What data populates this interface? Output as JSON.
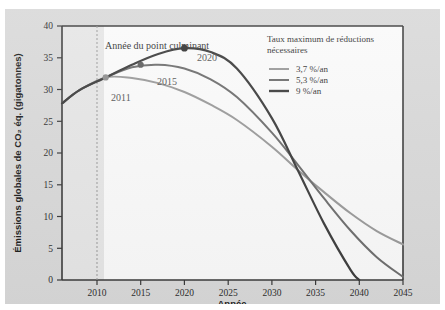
{
  "figure": {
    "background_color": "#d9d9d9",
    "plot_background_color": "#fafafa",
    "annotation": "Année du point culminant"
  },
  "legend": {
    "title_line1": "Taux maximum de réductions",
    "title_line2": "nécessaires",
    "entries": [
      {
        "label": "3,7 %/an",
        "color": "#9a9a9a"
      },
      {
        "label": "5,3 %/an",
        "color": "#6e6e6e"
      },
      {
        "label": "9 %/an",
        "color": "#3d3d3d"
      }
    ]
  },
  "peak_labels": [
    {
      "text": "2011",
      "x": 2011,
      "y": 31.9
    },
    {
      "text": "2015",
      "x": 2015,
      "y": 33.9
    },
    {
      "text": "2020",
      "x": 2020,
      "y": 36.5
    }
  ],
  "chart_data": {
    "type": "line",
    "title": "",
    "xlabel": "Année",
    "ylabel": "Émissions globales de CO₂ éq. (gigatonnes)",
    "xlim": [
      2006,
      2045
    ],
    "ylim": [
      0,
      40
    ],
    "xticks": [
      2010,
      2015,
      2020,
      2025,
      2030,
      2035,
      2040,
      2045
    ],
    "yticks": [
      0,
      5,
      10,
      15,
      20,
      25,
      30,
      35,
      40
    ],
    "grid": false,
    "legend_position": "upper right",
    "peak_year_line": 2010,
    "series": [
      {
        "name": "3,7 %/an",
        "color": "#9a9a9a",
        "peak_year": 2011,
        "peak_value": 31.9,
        "x": [
          2006,
          2008,
          2011,
          2014,
          2017,
          2020,
          2023,
          2026,
          2030,
          2033,
          2036,
          2039,
          2042,
          2045
        ],
        "values": [
          27.8,
          29.9,
          31.9,
          31.8,
          31.0,
          29.6,
          27.6,
          25.2,
          21.0,
          17.3,
          13.8,
          10.5,
          7.7,
          5.6
        ]
      },
      {
        "name": "5,3 %/an",
        "color": "#6e6e6e",
        "peak_year": 2015,
        "peak_value": 33.9,
        "x": [
          2006,
          2008,
          2011,
          2014,
          2017,
          2020,
          2023,
          2026,
          2030,
          2033,
          2036,
          2039,
          2042,
          2045
        ],
        "values": [
          27.8,
          29.9,
          31.9,
          33.5,
          33.9,
          33.3,
          31.6,
          28.8,
          23.2,
          18.1,
          12.8,
          7.8,
          3.6,
          0.5
        ]
      },
      {
        "name": "9 %/an",
        "color": "#3d3d3d",
        "peak_year": 2020,
        "peak_value": 36.5,
        "x": [
          2006,
          2008,
          2011,
          2014,
          2017,
          2020,
          2023,
          2026,
          2030,
          2033,
          2036,
          2039,
          2040
        ],
        "values": [
          27.8,
          29.9,
          31.9,
          33.9,
          35.6,
          36.5,
          35.9,
          33.3,
          25.5,
          17.2,
          8.8,
          1.6,
          0.0
        ]
      }
    ]
  }
}
